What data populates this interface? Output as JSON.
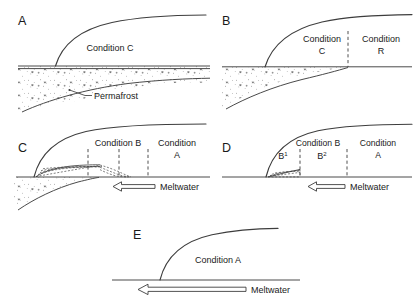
{
  "figure": {
    "background_color": "#ffffff",
    "ink_color": "#3d3d3d",
    "panels": [
      {
        "id": "A",
        "letter": "A",
        "labels": [
          {
            "name": "condition-c",
            "text": "Condition C"
          },
          {
            "name": "permafrost",
            "text": "Permafrost"
          }
        ],
        "has_permafrost_band": true,
        "has_meltwater_arrow": false,
        "dividers": 0
      },
      {
        "id": "B",
        "letter": "B",
        "labels": [
          {
            "name": "condition-c-line1",
            "text": "Condition"
          },
          {
            "name": "condition-c-line2",
            "text": "C"
          },
          {
            "name": "condition-r-line1",
            "text": "Condition"
          },
          {
            "name": "condition-r-line2",
            "text": "R"
          }
        ],
        "has_permafrost_band": true,
        "has_meltwater_arrow": false,
        "dividers": 1
      },
      {
        "id": "C",
        "letter": "C",
        "labels": [
          {
            "name": "condition-b",
            "text": "Condition B"
          },
          {
            "name": "condition-a-line1",
            "text": "Condition"
          },
          {
            "name": "condition-a-line2",
            "text": "A"
          },
          {
            "name": "meltwater",
            "text": "Meltwater"
          }
        ],
        "has_permafrost_band": true,
        "has_meltwater_arrow": true,
        "dividers": 3
      },
      {
        "id": "D",
        "letter": "D",
        "labels": [
          {
            "name": "condition-b",
            "text": "Condition B"
          },
          {
            "name": "condition-a-line1",
            "text": "Condition"
          },
          {
            "name": "condition-a-line2",
            "text": "A"
          },
          {
            "name": "sub-b1-base",
            "text": "B"
          },
          {
            "name": "sub-b1-exp",
            "text": "1"
          },
          {
            "name": "sub-b2-base",
            "text": "B"
          },
          {
            "name": "sub-b2-exp",
            "text": "2"
          },
          {
            "name": "meltwater",
            "text": "Meltwater"
          }
        ],
        "has_permafrost_band": false,
        "has_meltwater_arrow": true,
        "dividers": 2
      },
      {
        "id": "E",
        "letter": "E",
        "labels": [
          {
            "name": "condition-a",
            "text": "Condition A"
          },
          {
            "name": "meltwater",
            "text": "Meltwater"
          }
        ],
        "has_permafrost_band": false,
        "has_meltwater_arrow": true,
        "dividers": 0
      }
    ]
  },
  "panelA": {
    "letter": "A",
    "condition": "Condition C",
    "permafrost": "Permafrost"
  },
  "panelB": {
    "letter": "B",
    "conditionC_l1": "Condition",
    "conditionC_l2": "C",
    "conditionR_l1": "Condition",
    "conditionR_l2": "R"
  },
  "panelC": {
    "letter": "C",
    "conditionB": "Condition B",
    "conditionA_l1": "Condition",
    "conditionA_l2": "A",
    "meltwater": "Meltwater"
  },
  "panelD": {
    "letter": "D",
    "conditionB": "Condition B",
    "conditionA_l1": "Condition",
    "conditionA_l2": "A",
    "b1_base": "B",
    "b1_sup": "1",
    "b2_base": "B",
    "b2_sup": "2",
    "meltwater": "Meltwater"
  },
  "panelE": {
    "letter": "E",
    "conditionA": "Condition A",
    "meltwater": "Meltwater"
  },
  "icons": {
    "meltwater_arrow": "left-arrow-outline-icon",
    "permafrost_leader": "leader-line-icon"
  }
}
